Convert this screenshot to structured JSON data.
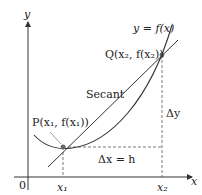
{
  "diagram": {
    "type": "secant-line-illustration",
    "axes": {
      "x_label": "x",
      "y_label": "y",
      "origin_label": "0"
    },
    "curve_label": "y = f(x)",
    "secant_label": "Secant",
    "points": {
      "P": {
        "label": "P(x₁, f(x₁))"
      },
      "Q": {
        "label": "Q(x₂, f(x₂))"
      }
    },
    "ticks": {
      "x1": "x₁",
      "x2": "x₂"
    },
    "delta_x_label": "Δx = h",
    "delta_y_label": "Δy",
    "colors": {
      "line": "#333333",
      "point": "#666666",
      "dashed": "#555555"
    }
  }
}
